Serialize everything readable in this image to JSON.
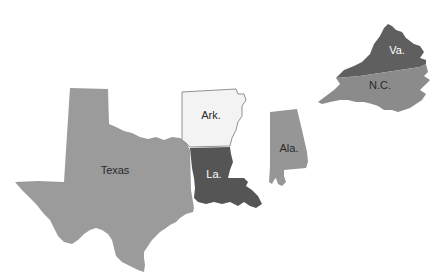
{
  "map": {
    "title": "",
    "states": [
      {
        "id": "texas",
        "label": "Texas",
        "fill": "#9b9b9b",
        "text_color": "#2a2a2a"
      },
      {
        "id": "arkansas",
        "label": "Ark.",
        "fill": "#f3f3f3",
        "stroke": "#777777",
        "text_color": "#2a2a2a"
      },
      {
        "id": "louisiana",
        "label": "La.",
        "fill": "#555555",
        "text_color": "#ffffff"
      },
      {
        "id": "alabama",
        "label": "Ala.",
        "fill": "#969696",
        "text_color": "#2a2a2a"
      },
      {
        "id": "virginia",
        "label": "Va.",
        "fill": "#5f5f5f",
        "text_color": "#ffffff"
      },
      {
        "id": "north-carolina",
        "label": "N.C.",
        "fill": "#8b8b8b",
        "text_color": "#2a2a2a"
      }
    ]
  }
}
